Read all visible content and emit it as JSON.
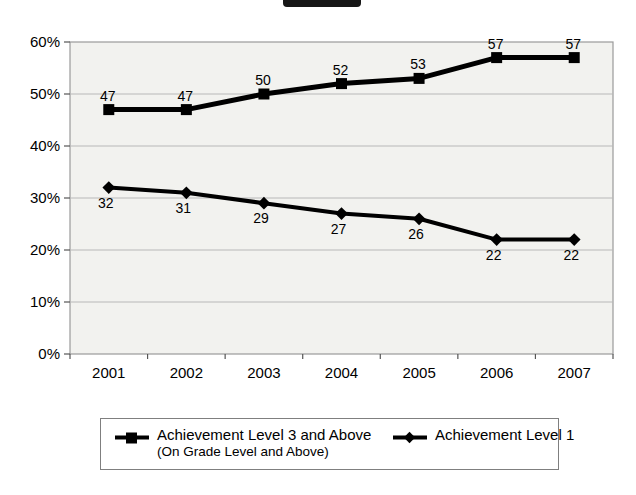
{
  "chart_data": {
    "type": "line",
    "categories": [
      "2001",
      "2002",
      "2003",
      "2004",
      "2005",
      "2006",
      "2007"
    ],
    "series": [
      {
        "name": "Achievement Level 3 and Above (On Grade Level and Above)",
        "marker": "square",
        "color": "#000000",
        "values": [
          47,
          47,
          50,
          52,
          53,
          57,
          57
        ],
        "label_position": "above"
      },
      {
        "name": "Achievement Level 1",
        "marker": "diamond",
        "color": "#000000",
        "values": [
          32,
          31,
          29,
          27,
          26,
          22,
          22
        ],
        "label_position": "below"
      }
    ],
    "title": "",
    "xlabel": "",
    "ylabel": "",
    "ylim": [
      0,
      60
    ],
    "ytick_step": 10,
    "ytick_labels": [
      "0%",
      "10%",
      "20%",
      "30%",
      "40%",
      "50%",
      "60%"
    ],
    "grid": true,
    "plot_background": "#f2f2ef",
    "gridline_color": "#b8b8b8",
    "plot_border_color": "#9a9a9a",
    "legend_position": "bottom"
  },
  "legend": {
    "entries": [
      {
        "label": "Achievement Level 3 and Above",
        "sublabel": "(On Grade Level and Above)",
        "marker": "square"
      },
      {
        "label": "Achievement Level 1",
        "sublabel": "",
        "marker": "diamond"
      }
    ]
  }
}
